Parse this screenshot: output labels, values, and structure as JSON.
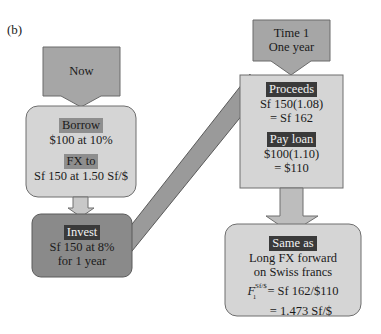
{
  "panel_label": "(b)",
  "colors": {
    "arrow_fill": "#a6a6a6",
    "light_box": "#d5d5d5",
    "dark_box": "#8a8a8a",
    "dark_tag": "#3a3a3a",
    "light_tag": "#8e8e8e",
    "border": "#6e6e6e"
  },
  "now_arrow": {
    "label": "Now"
  },
  "borrow_box": {
    "tag1": "Borrow",
    "line1": "$100 at 10%",
    "tag2": "FX to",
    "line2": "Sf 150 at 1.50 Sf/$"
  },
  "invest_box": {
    "tag": "Invest",
    "line1": "Sf 150 at 8%",
    "line2": "for 1 year"
  },
  "time1_arrow": {
    "line1": "Time 1",
    "line2": "One year"
  },
  "proceeds_box": {
    "tag1": "Proceeds",
    "line1": "Sf 150(1.08)",
    "line2": "= Sf 162",
    "tag2": "Pay loan",
    "line3": "$100(1.10)",
    "line4": "= $110"
  },
  "same_as_box": {
    "tag": "Same as",
    "line1": "Long FX forward",
    "line2": "on Swiss francs",
    "formula_symbol": "F",
    "formula_sup": "Sf/$",
    "formula_sub": "1",
    "formula_rhs": " = Sf 162/$110",
    "line4": "= 1.473 Sf/$"
  }
}
